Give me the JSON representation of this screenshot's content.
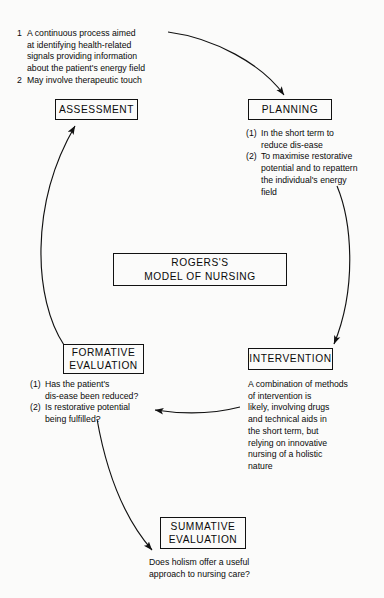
{
  "diagram": {
    "title": "Rogers's Model of Nursing",
    "center_node": {
      "label": "ROGERS'S\nMODEL OF NURSING"
    },
    "nodes": {
      "assessment": {
        "label": "ASSESSMENT"
      },
      "planning": {
        "label": "PLANNING"
      },
      "intervention": {
        "label": "INTERVENTION"
      },
      "formative_evaluation": {
        "label": "FORMATIVE\nEVALUATION"
      },
      "summative_evaluation": {
        "label": "SUMMATIVE\nEVALUATION"
      }
    },
    "assessment_detail": {
      "items": [
        {
          "marker": "1",
          "text": "A continuous process aimed\nat identifying health-related\nsignals providing information\nabout the patient's energy field"
        },
        {
          "marker": "2",
          "text": "May involve therapeutic touch"
        }
      ]
    },
    "planning_detail": {
      "items": [
        {
          "marker": "(1)",
          "text": "In the short term to\nreduce dis-ease"
        },
        {
          "marker": "(2)",
          "text": "To maximise restorative\npotential and to repattern\nthe individual's energy\nfield"
        }
      ]
    },
    "formative_detail": {
      "items": [
        {
          "marker": "(1)",
          "text": "Has the patient's\ndis-ease been reduced?"
        },
        {
          "marker": "(2)",
          "text": "Is restorative potential\nbeing fulfilled?"
        }
      ]
    },
    "intervention_detail": {
      "text": "A combination of methods\nof intervention is\nlikely, involving drugs\nand technical aids in\nthe short term, but\nrelying on innovative\nnursing of a holistic\nnature"
    },
    "summative_detail": {
      "text": "Does holism offer a useful\napproach to nursing care?"
    },
    "colors": {
      "ink": "#0a0a0a",
      "paper": "#fbfbfa",
      "border": "#111111"
    }
  }
}
